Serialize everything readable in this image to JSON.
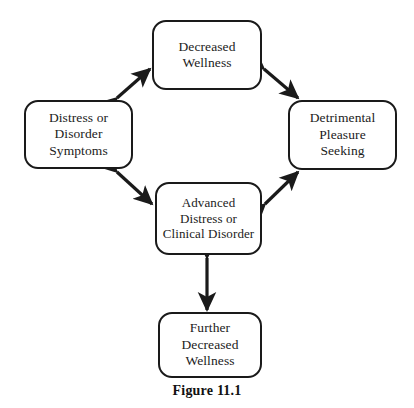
{
  "figure": {
    "caption": "Figure 11.1",
    "background_color": "#ffffff",
    "line_color": "#1a1a1a"
  },
  "diagram": {
    "type": "cycle-flowchart",
    "nodes": [
      {
        "id": "decreased-wellness",
        "position": "top",
        "lines": [
          "Decreased",
          "Wellness"
        ]
      },
      {
        "id": "distress-or-disorder-symptoms",
        "position": "left",
        "lines": [
          "Distress or",
          "Disorder",
          "Symptoms"
        ]
      },
      {
        "id": "detrimental-pleasure-seeking",
        "position": "right",
        "lines": [
          "Detrimental",
          "Pleasure",
          "Seeking"
        ]
      },
      {
        "id": "advanced-distress-or-clinical-disorder",
        "position": "center",
        "lines": [
          "Advanced",
          "Distress or",
          "Clinical Disorder"
        ]
      },
      {
        "id": "further-decreased-wellness",
        "position": "bottom",
        "lines": [
          "Further",
          "Decreased",
          "Wellness"
        ]
      }
    ],
    "connectors": [
      {
        "id": "top-left-connector",
        "from": "distress-or-disorder-symptoms",
        "to": "decreased-wellness",
        "style": "double-headed-arrow",
        "orientation": "diagonal-up-right"
      },
      {
        "id": "top-right-connector",
        "from": "decreased-wellness",
        "to": "detrimental-pleasure-seeking",
        "style": "double-headed-arrow",
        "orientation": "diagonal-down-right"
      },
      {
        "id": "bottom-left-connector",
        "from": "distress-or-disorder-symptoms",
        "to": "advanced-distress-or-clinical-disorder",
        "style": "double-headed-arrow",
        "orientation": "diagonal-down-right"
      },
      {
        "id": "bottom-right-connector",
        "from": "advanced-distress-or-clinical-disorder",
        "to": "detrimental-pleasure-seeking",
        "style": "double-headed-arrow",
        "orientation": "diagonal-up-right"
      },
      {
        "id": "center-bottom-connector",
        "from": "advanced-distress-or-clinical-disorder",
        "to": "further-decreased-wellness",
        "style": "double-headed-arrow",
        "orientation": "vertical"
      }
    ]
  }
}
